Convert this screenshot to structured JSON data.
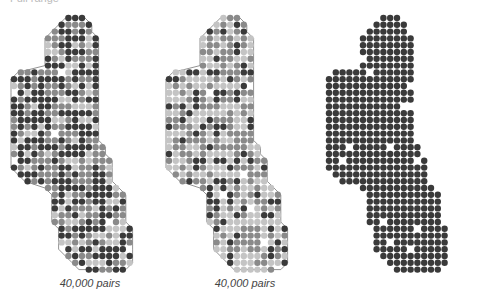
{
  "header": {
    "cut_text": "Full range"
  },
  "palette": {
    "dark": "#3a3a3a",
    "mid": "#8a8a8a",
    "light": "#c4c4c4",
    "outline": "#777777"
  },
  "grid": {
    "dx": 6.8,
    "dy": 6.8,
    "r": 3.2,
    "rows": [
      [
        8,
        10
      ],
      [
        7,
        11
      ],
      [
        6,
        11
      ],
      [
        5,
        12
      ],
      [
        5,
        12
      ],
      [
        5,
        12
      ],
      [
        5,
        12
      ],
      [
        5,
        12
      ],
      [
        1,
        12
      ],
      [
        0,
        12
      ],
      [
        0,
        12
      ],
      [
        0,
        12
      ],
      [
        0,
        12
      ],
      [
        0,
        12
      ],
      [
        0,
        12
      ],
      [
        0,
        12
      ],
      [
        0,
        12
      ],
      [
        0,
        12
      ],
      [
        0,
        12
      ],
      [
        0,
        13
      ],
      [
        0,
        13
      ],
      [
        0,
        14
      ],
      [
        0,
        14
      ],
      [
        1,
        14
      ],
      [
        2,
        14
      ],
      [
        5,
        15
      ],
      [
        6,
        16
      ],
      [
        6,
        16
      ],
      [
        6,
        16
      ],
      [
        6,
        16
      ],
      [
        6,
        16
      ],
      [
        7,
        17
      ],
      [
        7,
        17
      ],
      [
        7,
        17
      ],
      [
        7,
        17
      ],
      [
        8,
        17
      ],
      [
        9,
        17
      ],
      [
        10,
        16
      ]
    ]
  },
  "panels": [
    {
      "id": "panel-1",
      "x": 10,
      "caption": "40,000 pairs",
      "outline": true,
      "mix": {
        "dark": 0.45,
        "mid": 0.4,
        "light": 0.15
      },
      "seed": 3
    },
    {
      "id": "panel-2",
      "x": 165,
      "caption": "40,000 pairs",
      "outline": true,
      "mix": {
        "dark": 0.2,
        "mid": 0.35,
        "light": 0.45
      },
      "seed": 7
    },
    {
      "id": "panel-3",
      "x": 325,
      "caption": "",
      "outline": false,
      "mix": {
        "dark": 0.95,
        "mid": 0.0,
        "light": 0.0
      },
      "seed": 11
    }
  ]
}
